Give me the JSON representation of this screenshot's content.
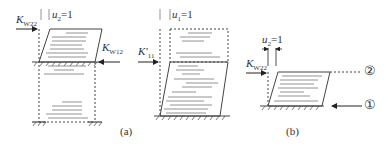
{
  "figure": {
    "panel_a": {
      "caption": "(a)",
      "left_diagram": {
        "force_left": {
          "symbol": "K",
          "sub": "W22"
        },
        "force_right": {
          "symbol": "K",
          "sub": "W12"
        },
        "displacement": {
          "symbol": "u",
          "sub": "2",
          "value": "=1"
        }
      },
      "right_diagram": {
        "force_left": {
          "symbol": "K'",
          "sub": "11"
        },
        "displacement": {
          "symbol": "u",
          "sub": "1",
          "value": "=1"
        }
      }
    },
    "panel_b": {
      "caption": "(b)",
      "force_left": {
        "symbol": "K",
        "sub": "W22"
      },
      "displacement": {
        "symbol": "u",
        "sub": "2",
        "value": "=1"
      },
      "level_markers": [
        "②",
        "①"
      ]
    }
  }
}
